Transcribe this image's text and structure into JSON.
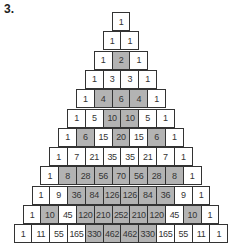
{
  "label": "3.",
  "shading_rule": "even numbers shaded",
  "colors": {
    "shaded": "#b3b3b3",
    "plain": "#ffffff",
    "border": "#333333"
  },
  "rows": [
    [
      1
    ],
    [
      1,
      1
    ],
    [
      1,
      2,
      1
    ],
    [
      1,
      3,
      3,
      1
    ],
    [
      1,
      4,
      6,
      4,
      1
    ],
    [
      1,
      5,
      10,
      10,
      5,
      1
    ],
    [
      1,
      6,
      15,
      20,
      15,
      6,
      1
    ],
    [
      1,
      7,
      21,
      35,
      35,
      21,
      7,
      1
    ],
    [
      1,
      8,
      28,
      56,
      70,
      56,
      28,
      8,
      1
    ],
    [
      1,
      9,
      36,
      84,
      126,
      126,
      84,
      36,
      9,
      1
    ],
    [
      1,
      10,
      45,
      120,
      210,
      252,
      210,
      120,
      45,
      10,
      1
    ],
    [
      1,
      11,
      55,
      165,
      330,
      462,
      462,
      330,
      165,
      55,
      11,
      1
    ]
  ]
}
